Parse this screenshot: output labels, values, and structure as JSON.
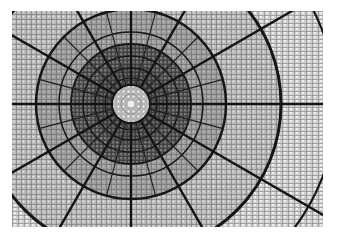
{
  "image": {
    "subject": "Stained-glass dome ceiling viewed from below",
    "palette": {
      "frame_dark": "#1a1a1a",
      "glass_mid": "#7d7d7d",
      "glass_light": "#c8c8c8",
      "rosette": "#d9d9d9",
      "background": "#ffffff"
    }
  }
}
